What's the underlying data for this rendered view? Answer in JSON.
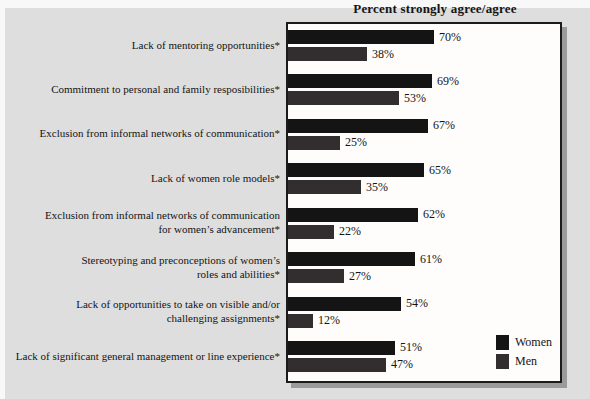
{
  "chart_data": {
    "type": "bar",
    "orientation": "horizontal",
    "title": "Percent strongly agree/agree",
    "categories": [
      "Lack of mentoring opportunities*",
      "Commitment to personal and family resposibilities*",
      "Exclusion from informal networks of communication*",
      "Lack of women role models*",
      "Exclusion from informal networks of communication\nfor women’s advancement*",
      "Stereotyping and preconceptions of women’s\nroles and abilities*",
      "Lack of opportunities to take on visible and/or\nchallenging assignments*",
      "Lack of significant general management or line experience*"
    ],
    "series": [
      {
        "name": "Women",
        "color": "#141414",
        "values": [
          70,
          69,
          67,
          65,
          62,
          61,
          54,
          51
        ]
      },
      {
        "name": "Men",
        "color": "#322e2f",
        "values": [
          38,
          53,
          25,
          35,
          22,
          27,
          12,
          47
        ]
      }
    ],
    "value_suffix": "%",
    "xlim": [
      0,
      133
    ],
    "grid": false,
    "legend_position": "bottom-right",
    "colors": {
      "plot_background": "#fefdfb",
      "panel_background": "#dedede",
      "plot_border": "#1b1b1b",
      "shadow": "#9b9b9b"
    }
  }
}
